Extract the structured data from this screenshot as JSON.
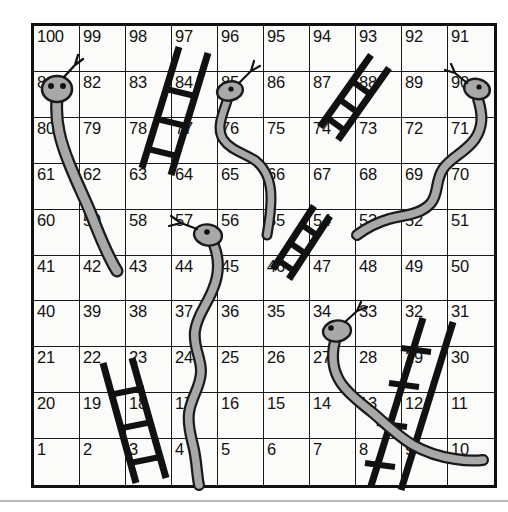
{
  "board": {
    "title": "Snakes and Ladders board",
    "rows": 10,
    "columns": 10,
    "numbering": "boustrophedon",
    "background_color": "#fbfbf9",
    "grid_line_color": "#1a1a1a",
    "number_color": "#111111",
    "snake_body_color": "#a8a8a8",
    "snake_outline_color": "#1a1a1a",
    "ladder_color": "#111111",
    "cells": [
      [
        {
          "number": "100"
        },
        {
          "number": "99"
        },
        {
          "number": "98"
        },
        {
          "number": "97"
        },
        {
          "number": "96"
        },
        {
          "number": "95"
        },
        {
          "number": "94"
        },
        {
          "number": "93"
        },
        {
          "number": "92"
        },
        {
          "number": "91"
        }
      ],
      [
        {
          "number": "81"
        },
        {
          "number": "82"
        },
        {
          "number": "83"
        },
        {
          "number": "84"
        },
        {
          "number": "85"
        },
        {
          "number": "86"
        },
        {
          "number": "87"
        },
        {
          "number": "88"
        },
        {
          "number": "89"
        },
        {
          "number": "90"
        }
      ],
      [
        {
          "number": "80"
        },
        {
          "number": "79"
        },
        {
          "number": "78"
        },
        {
          "number": "77"
        },
        {
          "number": "76"
        },
        {
          "number": "75"
        },
        {
          "number": "74"
        },
        {
          "number": "73"
        },
        {
          "number": "72"
        },
        {
          "number": "71"
        }
      ],
      [
        {
          "number": "61"
        },
        {
          "number": "62"
        },
        {
          "number": "63"
        },
        {
          "number": "64"
        },
        {
          "number": "65"
        },
        {
          "number": "66"
        },
        {
          "number": "67"
        },
        {
          "number": "68"
        },
        {
          "number": "69"
        },
        {
          "number": "70"
        }
      ],
      [
        {
          "number": "60"
        },
        {
          "number": "59"
        },
        {
          "number": "58"
        },
        {
          "number": "57"
        },
        {
          "number": "56"
        },
        {
          "number": "55"
        },
        {
          "number": "54"
        },
        {
          "number": "53"
        },
        {
          "number": "52"
        },
        {
          "number": "51"
        }
      ],
      [
        {
          "number": "41"
        },
        {
          "number": "42"
        },
        {
          "number": "43"
        },
        {
          "number": "44"
        },
        {
          "number": "45"
        },
        {
          "number": "46"
        },
        {
          "number": "47"
        },
        {
          "number": "48"
        },
        {
          "number": "49"
        },
        {
          "number": "50"
        }
      ],
      [
        {
          "number": "40"
        },
        {
          "number": "39"
        },
        {
          "number": "38"
        },
        {
          "number": "37"
        },
        {
          "number": "36"
        },
        {
          "number": "35"
        },
        {
          "number": "34"
        },
        {
          "number": "33"
        },
        {
          "number": "32"
        },
        {
          "number": "31"
        }
      ],
      [
        {
          "number": "21"
        },
        {
          "number": "22"
        },
        {
          "number": "23"
        },
        {
          "number": "24"
        },
        {
          "number": "25"
        },
        {
          "number": "26"
        },
        {
          "number": "27"
        },
        {
          "number": "28"
        },
        {
          "number": "29"
        },
        {
          "number": "30"
        }
      ],
      [
        {
          "number": "20"
        },
        {
          "number": "19"
        },
        {
          "number": "18"
        },
        {
          "number": "17"
        },
        {
          "number": "16"
        },
        {
          "number": "15"
        },
        {
          "number": "14"
        },
        {
          "number": "13"
        },
        {
          "number": "12"
        },
        {
          "number": "11"
        }
      ],
      [
        {
          "number": "1"
        },
        {
          "number": "2"
        },
        {
          "number": "3"
        },
        {
          "number": "4"
        },
        {
          "number": "5"
        },
        {
          "number": "6"
        },
        {
          "number": "7"
        },
        {
          "number": "8"
        },
        {
          "number": "9"
        },
        {
          "number": "10"
        }
      ]
    ],
    "snakes": [
      {
        "name": "snake-81-to-59",
        "head_cell": "81",
        "tail_cell": "59"
      },
      {
        "name": "snake-85-to-66",
        "head_cell": "85",
        "tail_cell": "66"
      },
      {
        "name": "snake-90-to-68",
        "head_cell": "90",
        "tail_cell": "68"
      },
      {
        "name": "snake-57-to-17",
        "head_cell": "57",
        "tail_cell": "17"
      },
      {
        "name": "snake-34-to-10",
        "head_cell": "34",
        "tail_cell": "10"
      }
    ],
    "ladders": [
      {
        "name": "ladder-77-to-98",
        "bottom_cell": "77",
        "top_cell": "98"
      },
      {
        "name": "ladder-87-to-93",
        "bottom_cell": "87",
        "top_cell": "93"
      },
      {
        "name": "ladder-55-to-67",
        "bottom_cell": "55",
        "top_cell": "67"
      },
      {
        "name": "ladder-3-to-22",
        "bottom_cell": "3",
        "top_cell": "22"
      },
      {
        "name": "ladder-8-to-31",
        "bottom_cell": "8",
        "top_cell": "31"
      }
    ]
  }
}
